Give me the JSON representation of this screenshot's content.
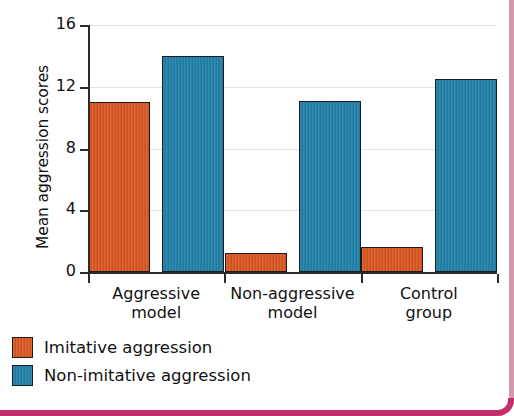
{
  "page": {
    "clipped_top_title": "",
    "frame_accent_color": "#c1306a"
  },
  "chart_data": {
    "type": "bar",
    "title": "",
    "subtitle": "",
    "xlabel": "",
    "ylabel": "Mean aggression scores",
    "ylim": [
      0,
      16
    ],
    "yticks": [
      0,
      4,
      8,
      12,
      16
    ],
    "ytick_labels": [
      "0",
      "4",
      "8",
      "12",
      "16"
    ],
    "grid": true,
    "grid_axis": "y",
    "legend_position": "below-left",
    "categories": [
      "Aggressive model",
      "Non-aggressive model",
      "Control group"
    ],
    "category_lines": [
      [
        "Aggressive",
        "model"
      ],
      [
        "Non-aggressive",
        "model"
      ],
      [
        "Control",
        "group"
      ]
    ],
    "series": [
      {
        "name": "Imitative aggression",
        "color": "#d9541d",
        "values": [
          11.0,
          1.2,
          1.6
        ]
      },
      {
        "name": "Non-imitative aggression",
        "color": "#2180a8",
        "values": [
          14.0,
          11.1,
          12.5
        ]
      }
    ]
  }
}
